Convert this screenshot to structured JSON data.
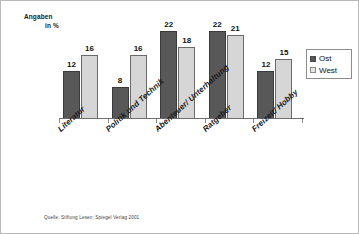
{
  "axis_caption": {
    "line1": "Angaben",
    "line2": "in %"
  },
  "legend": {
    "items": [
      {
        "label": "Ost",
        "color": "#585858"
      },
      {
        "label": "West",
        "color": "#d6d6d6"
      }
    ]
  },
  "source": "Quelle: Stiftung Lesen; Spiegel Verlag 2001",
  "chart_data": {
    "type": "bar",
    "title": "",
    "subtitle": "",
    "xlabel": "",
    "ylabel": "Angaben in %",
    "ylim": [
      0,
      24
    ],
    "grid": false,
    "legend_position": "top-right",
    "categories": [
      "Literatur",
      "Politik und Technik",
      "Abenteuer/ Unterhaltung",
      "Ratgeber",
      "Freizeit/ Hobby"
    ],
    "series": [
      {
        "name": "Ost",
        "color": "#585858",
        "values": [
          12,
          8,
          22,
          22,
          12
        ]
      },
      {
        "name": "West",
        "color": "#d6d6d6",
        "values": [
          16,
          16,
          18,
          21,
          15
        ]
      }
    ],
    "data_labels": {
      "Ost": [
        "12",
        "8",
        "22",
        "22",
        "12"
      ],
      "West": [
        "16",
        "16",
        "18",
        "21",
        "15"
      ]
    }
  }
}
